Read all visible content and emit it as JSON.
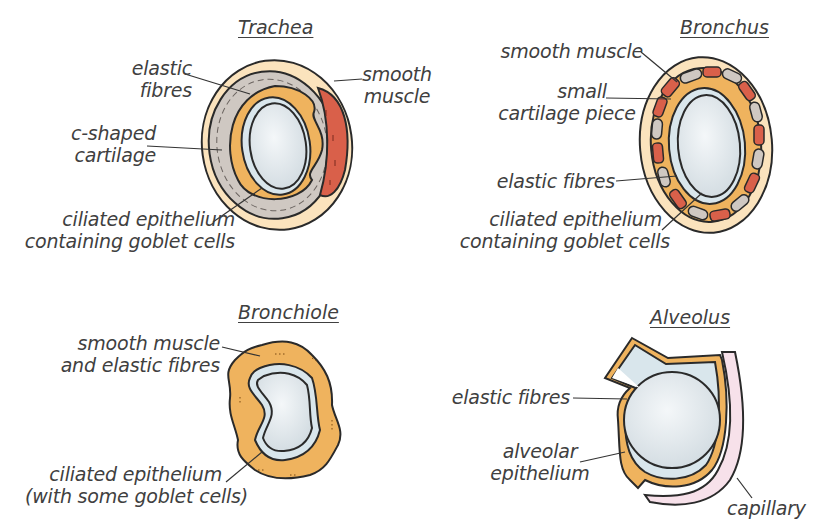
{
  "colors": {
    "outer_tissue": "#fbe3bd",
    "cartilage": "#cfc8c2",
    "elastic_fibres": "#efb35e",
    "smooth_muscle": "#d9604a",
    "epithelium": "#d9e6ec",
    "lumen": "#e8eef2",
    "capillary": "#f7e1ea",
    "outline": "#2a2a2a",
    "text": "#404040"
  },
  "trachea": {
    "title": "Trachea",
    "labels": {
      "elastic_1": "elastic",
      "elastic_2": "fibres",
      "muscle_1": "smooth",
      "muscle_2": "muscle",
      "cart_1": "c-shaped",
      "cart_2": "cartilage",
      "epi_1": "ciliated epithelium",
      "epi_2": "containing goblet cells"
    }
  },
  "bronchus": {
    "title": "Bronchus",
    "labels": {
      "muscle": "smooth muscle",
      "cart_1": "small",
      "cart_2": "cartilage piece",
      "elastic": "elastic fibres",
      "epi_1": "ciliated epithelium",
      "epi_2": "containing goblet cells"
    }
  },
  "bronchiole": {
    "title": "Bronchiole",
    "labels": {
      "muscle_1": "smooth muscle",
      "muscle_2": "and elastic fibres",
      "epi_1": "ciliated epithelium",
      "epi_2": "(with some goblet cells)"
    }
  },
  "alveolus": {
    "title": "Alveolus",
    "labels": {
      "elastic": "elastic fibres",
      "epi_1": "alveolar",
      "epi_2": "epithelium",
      "capillary": "capillary"
    }
  }
}
